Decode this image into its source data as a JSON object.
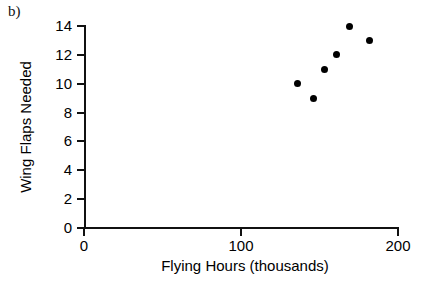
{
  "figure": {
    "panel_label": "b)"
  },
  "chart_data": {
    "type": "scatter",
    "title": "",
    "xlabel": "Flying Hours (thousands)",
    "ylabel": "Wing Flaps Needed",
    "xlim": [
      0,
      200
    ],
    "ylim": [
      0,
      14
    ],
    "xticks": [
      0,
      100,
      200
    ],
    "xticklabels": [
      "0",
      "100",
      "200"
    ],
    "yticks": [
      0,
      2,
      4,
      6,
      8,
      10,
      12,
      14
    ],
    "yticklabels": [
      "0",
      "2",
      "4",
      "6",
      "8",
      "10",
      "12",
      "14"
    ],
    "grid": false,
    "legend": false,
    "marker": "filled-circle",
    "marker_color": "#000000",
    "x": [
      136,
      146,
      153,
      161,
      169,
      182
    ],
    "y": [
      10,
      9,
      11,
      12,
      14,
      13
    ],
    "points": [
      {
        "x": 136,
        "y": 10
      },
      {
        "x": 146,
        "y": 9
      },
      {
        "x": 153,
        "y": 11
      },
      {
        "x": 161,
        "y": 12
      },
      {
        "x": 169,
        "y": 14
      },
      {
        "x": 182,
        "y": 13
      }
    ]
  },
  "colors": {
    "axis": "#111111",
    "marker": "#000000",
    "background": "#ffffff"
  }
}
